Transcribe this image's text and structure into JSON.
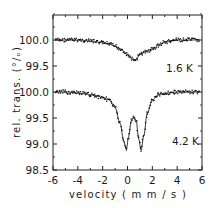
{
  "chart_data": {
    "type": "scatter",
    "title": "",
    "xlabel": "velocity (mm/s)",
    "ylabel": "rel. trans. (%)",
    "xlim": [
      -6,
      6
    ],
    "x_ticks": [
      -6,
      -4,
      -2,
      0,
      2,
      4,
      6
    ],
    "x_tick_labels": [
      "-6",
      "-4",
      "-2",
      "0",
      "2",
      "4",
      "6"
    ],
    "y_tick_labels": [
      "100.0",
      "99.5",
      "100.0",
      "99.5",
      "99.0",
      "98.5"
    ],
    "grid": false,
    "legend": null,
    "series": [
      {
        "name": "1.6 K",
        "annotation": "1.6 K",
        "baseline": 100.0,
        "description": "single broad absorption line with fit curve",
        "x": [
          -6,
          -5,
          -4,
          -3,
          -2,
          -1.5,
          -1,
          -0.5,
          0,
          0.3,
          0.5,
          0.7,
          1,
          1.5,
          2,
          2.5,
          3,
          4,
          5,
          6
        ],
        "values": [
          100.0,
          100.0,
          100.0,
          99.98,
          99.95,
          99.92,
          99.88,
          99.82,
          99.72,
          99.65,
          99.6,
          99.63,
          99.72,
          99.78,
          99.82,
          99.9,
          99.96,
          100.0,
          100.0,
          100.0
        ]
      },
      {
        "name": "4.2 K",
        "annotation": "4.2 K",
        "baseline": 100.0,
        "description": "quadrupole doublet with fit curve",
        "x": [
          -6,
          -5,
          -4,
          -3,
          -2,
          -1.5,
          -1,
          -0.6,
          -0.3,
          -0.1,
          0.1,
          0.3,
          0.5,
          0.7,
          0.9,
          1.1,
          1.3,
          1.6,
          2,
          2.5,
          3,
          4,
          5,
          6
        ],
        "values": [
          100.0,
          100.0,
          99.98,
          99.95,
          99.9,
          99.85,
          99.7,
          99.4,
          99.05,
          98.9,
          99.15,
          99.45,
          99.52,
          99.45,
          99.1,
          98.88,
          99.15,
          99.6,
          99.85,
          99.95,
          99.98,
          100.0,
          100.0,
          100.0
        ]
      }
    ],
    "annotations": [
      "1.6 K",
      "4.2 K"
    ]
  },
  "labels": {
    "xlabel": "velocity   ( m m / s )",
    "ylabel": "rel.  trans.  (°/ₒ)",
    "annot_top": "1.6 K",
    "annot_bottom": "4.2 K"
  }
}
